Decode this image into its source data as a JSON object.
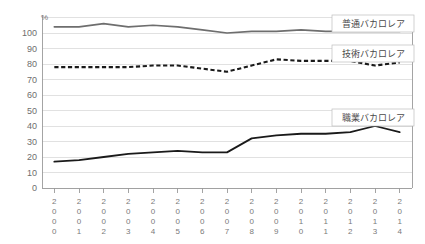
{
  "chart_data": {
    "type": "line",
    "title": "",
    "xlabel": "",
    "ylabel": "%",
    "unit_label": "%",
    "grid": true,
    "legend_position": "inline-right",
    "ylim": [
      0,
      110
    ],
    "yticks": [
      0,
      10,
      20,
      30,
      40,
      50,
      60,
      70,
      80,
      90,
      100
    ],
    "categories": [
      "2000",
      "2001",
      "2002",
      "2003",
      "2004",
      "2005",
      "2006",
      "2007",
      "2008",
      "2009",
      "2010",
      "2011",
      "2012",
      "2013",
      "2014"
    ],
    "series": [
      {
        "name": "普通バカロレア",
        "style": "solid-gray",
        "color": "#6e6e6e",
        "values": [
          104,
          104,
          106,
          104,
          105,
          104,
          102,
          100,
          101,
          101,
          102,
          101,
          101,
          101,
          101
        ]
      },
      {
        "name": "技術バカロレア",
        "style": "dashed-black",
        "color": "#1a1a1a",
        "values": [
          78,
          78,
          78,
          78,
          79,
          79,
          77,
          75,
          79,
          83,
          82,
          82,
          82,
          79,
          81
        ]
      },
      {
        "name": "職業バカロレア",
        "style": "solid-black",
        "color": "#1a1a1a",
        "values": [
          17,
          18,
          20,
          22,
          23,
          24,
          23,
          23,
          32,
          34,
          35,
          35,
          36,
          40,
          36
        ]
      }
    ]
  },
  "legend": {
    "items": [
      {
        "label": "普通バカロレア"
      },
      {
        "label": "技術バカロレア"
      },
      {
        "label": "職業バカロレア"
      }
    ]
  }
}
